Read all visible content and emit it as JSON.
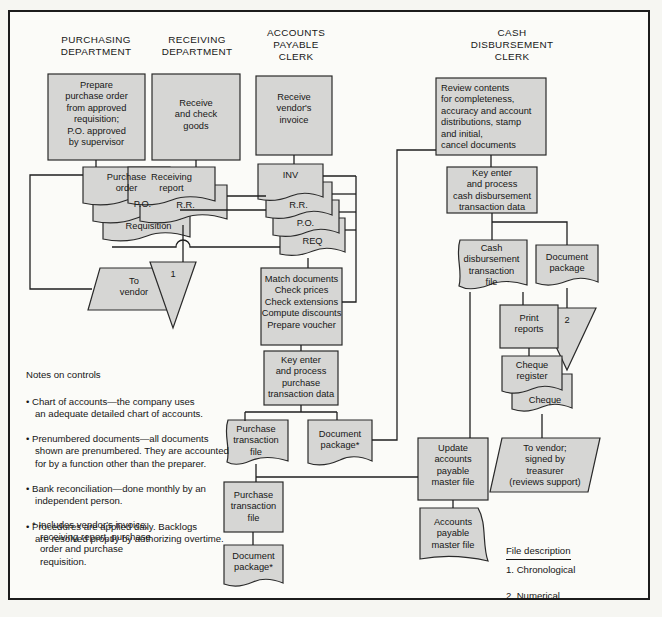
{
  "headers": {
    "purchasing": "PURCHASING\nDEPARTMENT",
    "receiving": "RECEIVING\nDEPARTMENT",
    "ap_clerk": "ACCOUNTS\nPAYABLE\nCLERK",
    "cd_clerk": "CASH\nDISBURSEMENT\nCLERK"
  },
  "nodes": {
    "prepare_po": "Prepare\npurchase order\nfrom approved\nrequisition;\nP.O. approved\nby supervisor",
    "receive_goods": "Receive\nand check\ngoods",
    "receive_invoice": "Receive\nvendor's\ninvoice",
    "review_contents": "Review contents\nfor completeness,\naccuracy and account\ndistributions, stamp\nand initial,\ncancel documents",
    "key_enter_cd": "Key enter\nand process\ncash disbursement\ntransaction data",
    "purchase_order": "Purchase\norder",
    "po_copy": "P.O.",
    "requisition": "Requisition",
    "to_vendor": "To\nvendor",
    "receiving_report": "Receiving\nreport",
    "rr_copy": "R.R.",
    "file_1": "1",
    "inv": "INV",
    "rr_2": "R.R.",
    "po_2": "P.O.",
    "req": "REQ",
    "match_documents": "Match documents\nCheck prices\nCheck extensions\nCompute discounts\nPrepare voucher",
    "key_enter_purchase": "Key enter\nand process\npurchase\ntransaction data",
    "purchase_tx_file_1": "Purchase\ntransaction\nfile",
    "doc_package_1": "Document\npackage*",
    "purchase_tx_file_2": "Purchase\ntransaction\nfile",
    "doc_package_2": "Document\npackage*",
    "cash_disb_file": "Cash\ndisbursement\ntransaction\nfile",
    "doc_package_cd": "Document\npackage",
    "file_2": "2",
    "print_reports": "Print\nreports",
    "cheque_register": "Cheque\nregister",
    "cheque": "Cheque",
    "to_vendor_treasurer": "To vendor;\nsigned by\ntreasurer\n(reviews support)",
    "update_ap_master": "Update\naccounts\npayable\nmaster file",
    "ap_master_file": "Accounts\npayable\nmaster file"
  },
  "notes": {
    "title": "Notes on controls",
    "items": [
      "• Chart of accounts—the company uses\nan adequate detailed chart of accounts.",
      "• Prenumbered documents—all documents\nshown are prenumbered. They are accounted\nfor by a function other than the preparer.",
      "• Bank reconciliation—done monthly by an\nindependent person.",
      "• Procedures are applied daily. Backlogs\nare resolved proptly by authorizing overtime."
    ]
  },
  "footnote": "* Includes vendor's invoice,\nreceiving report, purchase\norder and purchase\nrequisition.",
  "file_description": {
    "title": "File description",
    "items": [
      "1. Chronological",
      "2. Numerical"
    ]
  }
}
